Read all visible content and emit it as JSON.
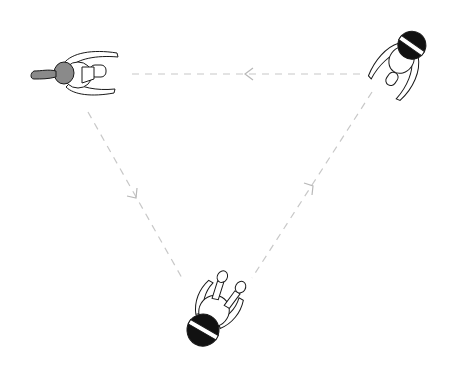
{
  "diagram": {
    "colors": {
      "background": "#ffffff",
      "line": "#1a1a1a",
      "hair": "#111111",
      "grey_hair": "#8a8a8a",
      "dash": "#c8c8c8"
    },
    "figures": [
      {
        "id": "person-left",
        "x": 72,
        "y": 75,
        "rotation": 0,
        "hair": "grey-ponytail"
      },
      {
        "id": "person-right",
        "x": 412,
        "y": 55,
        "rotation": 125,
        "hair": "black-headband"
      },
      {
        "id": "person-bottom",
        "x": 208,
        "y": 318,
        "rotation": 235,
        "hair": "black-headband"
      }
    ],
    "arrows": [
      {
        "from": "person-right",
        "to": "person-left",
        "path": "top edge",
        "direction": "left"
      },
      {
        "from": "person-left",
        "to": "person-bottom",
        "path": "left edge",
        "direction": "down-right"
      },
      {
        "from": "person-bottom",
        "to": "person-right",
        "path": "right edge",
        "direction": "up-right"
      }
    ]
  }
}
